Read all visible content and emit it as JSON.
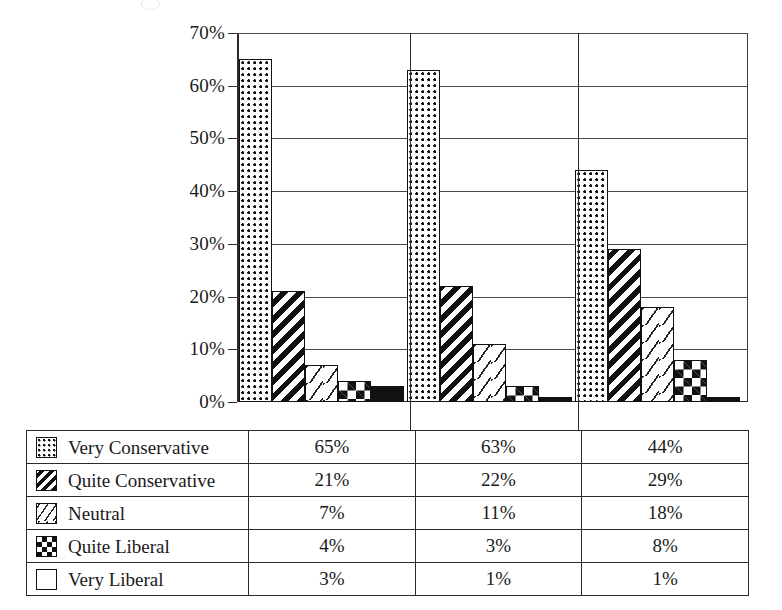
{
  "chart_data": {
    "type": "bar",
    "title": "",
    "xlabel": "",
    "ylabel": "",
    "ylim": [
      0,
      70
    ],
    "yunit": "%",
    "grid": true,
    "legend_position": "bottom-table",
    "categories": [
      "Group 1",
      "Group 2",
      "Group 3"
    ],
    "ytick_labels": [
      "0%",
      "10%",
      "20%",
      "30%",
      "40%",
      "50%",
      "60%",
      "70%"
    ],
    "ytick_values": [
      0,
      10,
      20,
      30,
      40,
      50,
      60,
      70
    ],
    "series": [
      {
        "name": "Very Conservative",
        "pattern": "dots",
        "values": [
          65,
          63,
          44
        ],
        "labels": [
          "65%",
          "63%",
          "44%"
        ]
      },
      {
        "name": "Quite Conservative",
        "pattern": "diag",
        "values": [
          21,
          22,
          29
        ],
        "labels": [
          "21%",
          "22%",
          "29%"
        ]
      },
      {
        "name": "Neutral",
        "pattern": "dash",
        "values": [
          7,
          11,
          18
        ],
        "labels": [
          "7%",
          "11%",
          "18%"
        ]
      },
      {
        "name": "Quite Liberal",
        "pattern": "check",
        "values": [
          4,
          3,
          8
        ],
        "labels": [
          "4%",
          "3%",
          "8%"
        ]
      },
      {
        "name": "Very Liberal",
        "pattern": "solid",
        "values": [
          3,
          1,
          1
        ],
        "labels": [
          "3%",
          "1%",
          "1%"
        ]
      }
    ]
  },
  "colors": {
    "ink": "#111111",
    "axis": "#2b2b2b",
    "grid": "#4a4a4a",
    "background": "#ffffff"
  }
}
